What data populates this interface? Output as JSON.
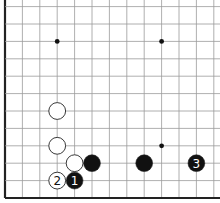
{
  "diagram": {
    "type": "go-board-fragment",
    "grid": {
      "origin_x": 5,
      "origin_y": 198,
      "spacing": 17.4,
      "cols": 13,
      "rows": 12,
      "line_color": "#9a9a9a",
      "edge_color": "#222222",
      "edges": [
        "left",
        "bottom"
      ]
    },
    "hoshi": [
      {
        "col": 3,
        "row": 9
      },
      {
        "col": 9,
        "row": 9
      },
      {
        "col": 9,
        "row": 3
      }
    ],
    "stones": [
      {
        "color": "white",
        "col": 3,
        "row": 5,
        "label": ""
      },
      {
        "color": "white",
        "col": 3,
        "row": 3,
        "label": ""
      },
      {
        "color": "white",
        "col": 4,
        "row": 2,
        "label": ""
      },
      {
        "color": "black",
        "col": 5,
        "row": 2,
        "label": ""
      },
      {
        "color": "black",
        "col": 8,
        "row": 2,
        "label": ""
      },
      {
        "color": "black",
        "col": 11,
        "row": 2,
        "label": "3"
      },
      {
        "color": "white",
        "col": 3,
        "row": 1,
        "label": "2"
      },
      {
        "color": "black",
        "col": 4,
        "row": 1,
        "label": "1"
      }
    ],
    "colors": {
      "black_stone": "#111111",
      "white_stone": "#ffffff",
      "stone_outline": "#222222"
    }
  }
}
